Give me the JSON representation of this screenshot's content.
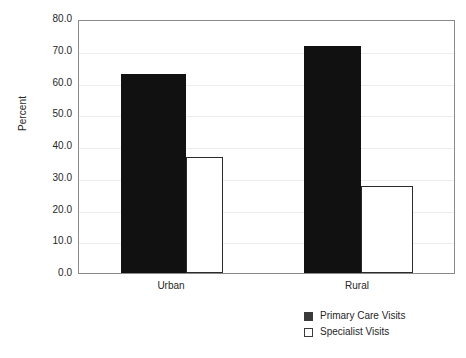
{
  "chart_data": {
    "type": "bar",
    "title": "",
    "xlabel": "",
    "ylabel": "Percent",
    "categories": [
      "Urban",
      "Rural"
    ],
    "series": [
      {
        "name": "Primary Care Visits",
        "color": "#111111",
        "values": [
          62.8,
          71.6
        ]
      },
      {
        "name": "Specialist Visits",
        "color": "#ffffff",
        "values": [
          36.5,
          27.5
        ]
      }
    ],
    "ylim": [
      0.0,
      80.0
    ],
    "ytick_labels": [
      "80.0",
      "70.0",
      "60.0",
      "50.0",
      "40.0",
      "30.0",
      "20.0",
      "10.0",
      "0.0"
    ],
    "ytick_values": [
      80.0,
      70.0,
      60.0,
      50.0,
      40.0,
      30.0,
      20.0,
      10.0,
      0.0
    ],
    "grid": true,
    "legend_position": "bottom-right"
  },
  "axis": {
    "y_title": "Percent",
    "ticks": [
      {
        "label": "80.0"
      },
      {
        "label": "70.0"
      },
      {
        "label": "60.0"
      },
      {
        "label": "50.0"
      },
      {
        "label": "40.0"
      },
      {
        "label": "30.0"
      },
      {
        "label": "20.0"
      },
      {
        "label": "10.0"
      },
      {
        "label": "0.0"
      }
    ],
    "categories": [
      {
        "label": "Urban"
      },
      {
        "label": "Rural"
      }
    ]
  },
  "legend": {
    "items": [
      {
        "label": "Primary Care Visits",
        "swatch": "filled-dark-square"
      },
      {
        "label": "Specialist Visits",
        "swatch": "open-white-square"
      }
    ]
  }
}
